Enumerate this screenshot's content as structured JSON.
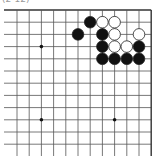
{
  "caption": "(2-12)",
  "board": {
    "x0": 17,
    "y0": 10,
    "spacing": 12.2,
    "cols": 12,
    "rows": 12,
    "top_edge": true,
    "right_edge": true,
    "left_edge": false,
    "bottom_edge": false,
    "star_points": [
      [
        2,
        3
      ],
      [
        2,
        9
      ],
      [
        8,
        9
      ]
    ],
    "stones": [
      {
        "col": 6,
        "row": 1,
        "color": "black"
      },
      {
        "col": 7,
        "row": 1,
        "color": "white"
      },
      {
        "col": 8,
        "row": 1,
        "color": "white"
      },
      {
        "col": 5,
        "row": 2,
        "color": "black"
      },
      {
        "col": 7,
        "row": 2,
        "color": "black"
      },
      {
        "col": 8,
        "row": 2,
        "color": "white"
      },
      {
        "col": 10,
        "row": 2,
        "color": "white"
      },
      {
        "col": 7,
        "row": 3,
        "color": "black"
      },
      {
        "col": 8,
        "row": 3,
        "color": "white"
      },
      {
        "col": 9,
        "row": 3,
        "color": "white"
      },
      {
        "col": 10,
        "row": 3,
        "color": "black"
      },
      {
        "col": 7,
        "row": 4,
        "color": "black"
      },
      {
        "col": 8,
        "row": 4,
        "color": "black"
      },
      {
        "col": 9,
        "row": 4,
        "color": "black"
      },
      {
        "col": 10,
        "row": 4,
        "color": "black"
      }
    ]
  },
  "colors": {
    "line": "#555555",
    "black": "#111111",
    "white": "#ffffff",
    "edge": "#333333"
  }
}
